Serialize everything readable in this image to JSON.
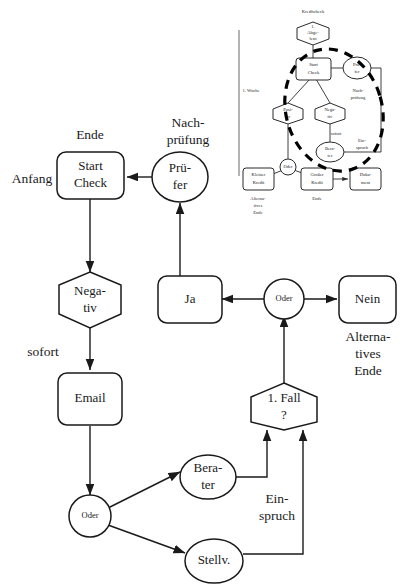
{
  "diagram": {
    "colors": {
      "background": "#ffffff",
      "stroke": "#1a1a1a",
      "dashed_region": "#000000",
      "axis": "#6a6a6a"
    },
    "main": {
      "nodes": {
        "start_check": "Start\nCheck",
        "start_check_line1": "Start",
        "start_check_line2": "Check",
        "pruefer_line1": "Prü-",
        "pruefer_line2": "fer",
        "negativ_line1": "Nega-",
        "negativ_line2": "tiv",
        "ja": "Ja",
        "oder_mid": "Oder",
        "nein": "Nein",
        "email": "Email",
        "fall_line1": "1. Fall",
        "fall_line2": "?",
        "oder_low": "Oder",
        "berater_line1": "Bera-",
        "berater_line2": "ter",
        "stellv": "Stellv."
      },
      "annotations": {
        "anfang": "Anfang",
        "ende": "Ende",
        "nachpruefung_line1": "Nach-",
        "nachpruefung_line2": "prüfung",
        "sofort": "sofort",
        "alternatives_line1": "Alterna-",
        "alternatives_line2": "tives",
        "alternatives_line3": "Ende",
        "einspruch_line1": "Ein-",
        "einspruch_line2": "spruch"
      }
    },
    "inset": {
      "axis_label": "1. Woche",
      "nodes": {
        "abgelehnt_line1": "1.",
        "abgelehnt_line2": "Abge-",
        "abgelehnt_line3": "lent",
        "start_check_line1": "Start",
        "start_check_line2": "Check",
        "pruefer_line1": "Prü-",
        "pruefer_line2": "fer",
        "positiv_line1": "Posi-",
        "positiv_line2": "tiv",
        "negativ_line1": "Nega-",
        "negativ_line2": "tiv",
        "berater_line1": "Bera-",
        "berater_line2": "ter",
        "oder": "Oder",
        "kleiner_kredit_line1": "Kleiner",
        "kleiner_kredit_line2": "Kredit",
        "grosser_kredit_line1": "Großer",
        "grosser_kredit_line2": "Kredit",
        "dokument_line1": "Doku-",
        "dokument_line2": "ment"
      },
      "annotations": {
        "kreditcheck": "Kreditcheck",
        "nachpruefung_line1": "Nach-",
        "nachpruefung_line2": "prüfung",
        "sofort": "sofort",
        "einspruch_line1": "Ein-",
        "einspruch_line2": "spruch",
        "alternatives_line1": "Alterna-",
        "alternatives_line2": "tives",
        "alternatives_line3": "Ende",
        "ende": "Ende"
      }
    }
  }
}
